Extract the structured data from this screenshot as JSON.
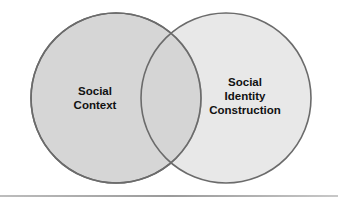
{
  "diagram": {
    "type": "venn",
    "circles": [
      {
        "id": "left",
        "label_lines": [
          "Social",
          "Context"
        ],
        "cx": 116,
        "cy": 98,
        "r": 85,
        "fill": "#d6d6d6",
        "stroke": "#6b6b6b"
      },
      {
        "id": "right",
        "label_lines": [
          "Social",
          "Identity",
          "Construction"
        ],
        "cx": 226,
        "cy": 98,
        "r": 85,
        "fill": "#d6d6d6",
        "stroke": "#6b6b6b"
      }
    ],
    "left_label": {
      "line1": "Social",
      "line2": "Context"
    },
    "right_label": {
      "line1": "Social",
      "line2": "Identity",
      "line3": "Construction"
    }
  }
}
